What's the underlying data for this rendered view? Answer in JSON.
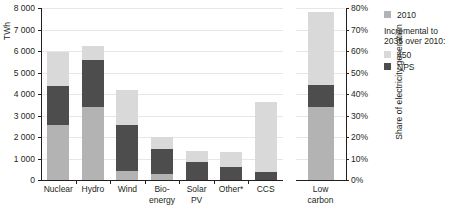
{
  "chart_data": {
    "type": "bar",
    "title": "",
    "subtitle": "",
    "stacked": true,
    "grid": true,
    "categories": [
      "Nuclear",
      "Hydro",
      "Wind",
      "Bio-\nenergy",
      "Solar\nPV",
      "Other*",
      "CCS"
    ],
    "series": [
      {
        "name": "2010",
        "color": "#b3b3b3",
        "values": [
          2550,
          3400,
          400,
          300,
          0,
          0,
          0
        ]
      },
      {
        "name": "NPS",
        "color": "#4d4d4d",
        "values": [
          1800,
          2200,
          2150,
          1150,
          850,
          620,
          350
        ]
      },
      {
        "name": "450",
        "color": "#d9d9d9",
        "values": [
          1600,
          650,
          1650,
          550,
          500,
          680,
          3300
        ]
      }
    ],
    "totals": [
      5950,
      6250,
      4200,
      2000,
      1350,
      1300,
      3650
    ],
    "xlabel": "",
    "ylabel": "TWh",
    "ylim": [
      0,
      8000
    ],
    "yticks": [
      0,
      1000,
      2000,
      3000,
      4000,
      5000,
      6000,
      7000,
      8000
    ],
    "ytick_labels": [
      "0",
      "1 000",
      "2 000",
      "3 000",
      "4 000",
      "5 000",
      "6 000",
      "7 000",
      "8 000"
    ],
    "secondary_axis": {
      "label": "Share of electricity generation",
      "ylim": [
        0,
        80
      ],
      "yticks": [
        0,
        10,
        20,
        30,
        40,
        50,
        60,
        70,
        80
      ],
      "ytick_labels": [
        "0%",
        "10%",
        "20%",
        "30%",
        "40%",
        "50%",
        "60%",
        "70%",
        "80%"
      ],
      "categories": [
        "Low\ncarbon"
      ],
      "series": [
        {
          "name": "2010",
          "color": "#b3b3b3",
          "values": [
            34
          ]
        },
        {
          "name": "NPS",
          "color": "#4d4d4d",
          "values": [
            10
          ]
        },
        {
          "name": "450",
          "color": "#d9d9d9",
          "values": [
            34
          ]
        }
      ],
      "totals": [
        78
      ]
    },
    "legend": {
      "position": "right",
      "entries": [
        {
          "label": "2010",
          "color": "#b3b3b3"
        },
        {
          "label": "450",
          "color": "#d9d9d9"
        },
        {
          "label": "NPS",
          "color": "#4d4d4d"
        }
      ],
      "heading": "Incremental to 2035 over 2010:"
    }
  },
  "colors": {
    "series_2010": "#b3b3b3",
    "series_450": "#d9d9d9",
    "series_nps": "#4d4d4d",
    "axis": "#231f20",
    "grid": "#e6e6e6",
    "background": "#ffffff"
  }
}
